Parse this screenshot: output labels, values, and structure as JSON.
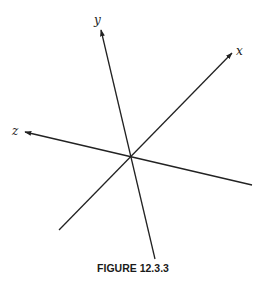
{
  "figure": {
    "caption": "FIGURE 12.3.3",
    "colors": {
      "line": "#222222",
      "background": "#ffffff"
    },
    "origin": {
      "x": 131,
      "y": 157
    },
    "axes": [
      {
        "name": "x",
        "label": "x",
        "positive_end": {
          "x": 232,
          "y": 53
        },
        "negative_end": {
          "x": 59,
          "y": 230
        },
        "label_pos": {
          "x": 236,
          "y": 45
        }
      },
      {
        "name": "y",
        "label": "y",
        "positive_end": {
          "x": 101,
          "y": 30
        },
        "negative_end": {
          "x": 155,
          "y": 259
        },
        "label_pos": {
          "x": 94,
          "y": 14
        }
      },
      {
        "name": "z",
        "label": "z",
        "positive_end": {
          "x": 25,
          "y": 132
        },
        "negative_end": {
          "x": 252,
          "y": 185
        },
        "label_pos": {
          "x": 12,
          "y": 125
        }
      }
    ]
  }
}
